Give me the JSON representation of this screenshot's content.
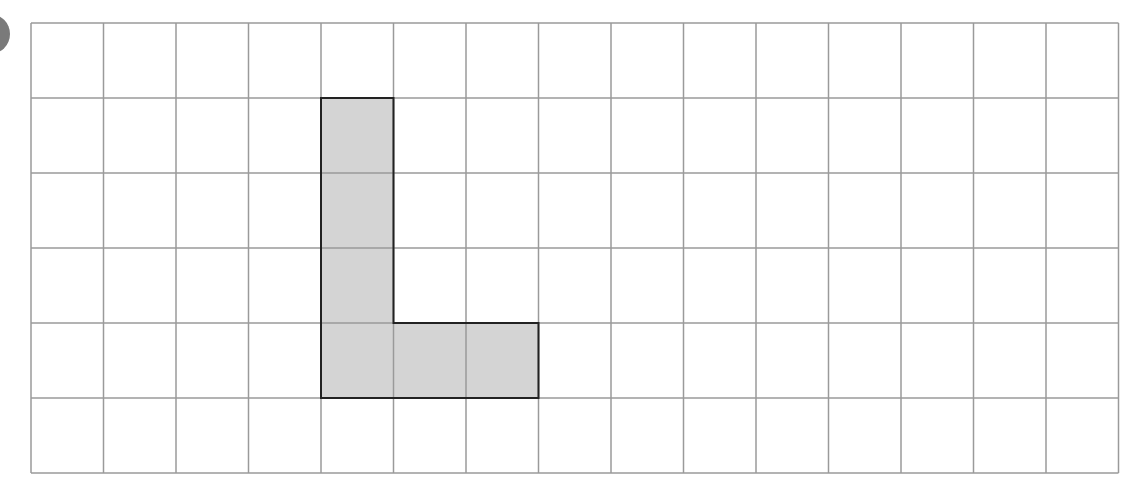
{
  "figure": {
    "grid": {
      "columns": 15,
      "rows": 6,
      "cell_width": 72.5,
      "cell_height": 75
    },
    "shaded_cells": [
      {
        "col": 4,
        "row": 1
      },
      {
        "col": 4,
        "row": 2
      },
      {
        "col": 4,
        "row": 3
      },
      {
        "col": 4,
        "row": 4
      },
      {
        "col": 5,
        "row": 4
      },
      {
        "col": 6,
        "row": 4
      }
    ],
    "colors": {
      "grid_line": "#9a9a9a",
      "shape_fill": "#d4d4d4",
      "shape_outline": "#222222",
      "badge": "#7a7a7a"
    }
  }
}
